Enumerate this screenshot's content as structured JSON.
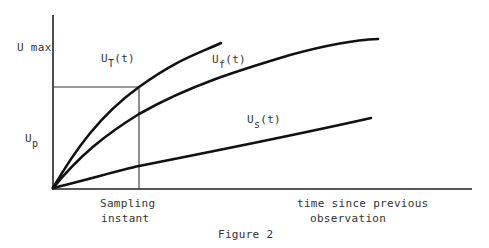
{
  "figure": {
    "caption": "Figure 2",
    "axes": {
      "x_label_line1": "time since previous",
      "x_label_line2": "observation",
      "y_tick_max": "U max",
      "y_tick_p_main": "U",
      "y_tick_p_sub": "p"
    },
    "marker": {
      "label_line1": "Sampling",
      "label_line2": "instant"
    },
    "curves": [
      {
        "id": "UT",
        "main": "U",
        "sub": "T",
        "arg": "(t)",
        "shape": "steep concave"
      },
      {
        "id": "Uf",
        "main": "U",
        "sub": "f",
        "arg": "(t)",
        "shape": "moderate concave"
      },
      {
        "id": "Us",
        "main": "U",
        "sub": "s",
        "arg": "(t)",
        "shape": "near-linear shallow"
      }
    ],
    "colors": {
      "line": "#111111",
      "axis": "#222222",
      "text": "#333333",
      "background": "#ffffff"
    }
  }
}
